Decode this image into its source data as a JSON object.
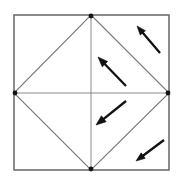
{
  "figure": {
    "canvas": {
      "width": 182,
      "height": 181,
      "background": "#ffffff"
    },
    "colors": {
      "square_stroke": "#6e6e6e",
      "diamond_stroke": "#7a7a7a",
      "cross_stroke": "#8a8a8a",
      "arrow_stroke": "#111111",
      "vertex_dot": "#141414",
      "background": "#ffffff"
    },
    "strokes": {
      "square_width": 1.6,
      "diamond_width": 1.1,
      "cross_width": 1.0,
      "arrow_width": 2.3
    },
    "square": {
      "label": "outer-square",
      "x1": 14,
      "y1": 15,
      "x2": 169,
      "y2": 170
    },
    "diamond": {
      "label": "inscribed-diamond",
      "points": "91,15 169,93 91,170 14,93"
    },
    "cross_lines": [
      {
        "label": "vertical-median",
        "x1": 91,
        "y1": 15,
        "x2": 91,
        "y2": 170
      },
      {
        "label": "horizontal-median",
        "x1": 14,
        "y1": 93,
        "x2": 169,
        "y2": 93
      }
    ],
    "vertex_dots": [
      {
        "label": "top-midpoint-vertex",
        "cx": 91,
        "cy": 16,
        "r": 2.4
      },
      {
        "label": "right-midpoint-vertex",
        "cx": 168,
        "cy": 93,
        "r": 2.4
      },
      {
        "label": "bottom-midpoint-vertex",
        "cx": 91,
        "cy": 169,
        "r": 2.4
      },
      {
        "label": "left-midpoint-vertex",
        "cx": 15,
        "cy": 93,
        "r": 2.4
      }
    ],
    "arrows": [
      {
        "label": "arrow-top-right",
        "direction": "up-left",
        "tail_x": 160,
        "tail_y": 53,
        "tip_x": 137,
        "tip_y": 26,
        "head_size": 9
      },
      {
        "label": "arrow-upper-middle",
        "direction": "up-left",
        "tail_x": 126,
        "tail_y": 86,
        "tip_x": 98,
        "tip_y": 57,
        "head_size": 10
      },
      {
        "label": "arrow-lower-middle",
        "direction": "down-left",
        "tail_x": 126,
        "tail_y": 101,
        "tip_x": 96,
        "tip_y": 125,
        "head_size": 10
      },
      {
        "label": "arrow-bottom-right",
        "direction": "down-left",
        "tail_x": 164,
        "tail_y": 140,
        "tip_x": 136,
        "tip_y": 161,
        "head_size": 9
      }
    ]
  }
}
